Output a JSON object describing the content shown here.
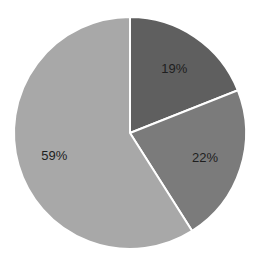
{
  "chart_data": {
    "type": "pie",
    "title": "",
    "categories": [
      "Slice 1",
      "Slice 2",
      "Slice 3"
    ],
    "values": [
      19,
      22,
      59
    ],
    "labels": [
      "19%",
      "22%",
      "59%"
    ],
    "colors": [
      "#5f5f5f",
      "#7b7b7b",
      "#a8a8a8"
    ],
    "start_angle": "12 o'clock",
    "direction": "clockwise",
    "legend": "none"
  },
  "slices": [
    {
      "label": "19%"
    },
    {
      "label": "22%"
    },
    {
      "label": "59%"
    }
  ]
}
